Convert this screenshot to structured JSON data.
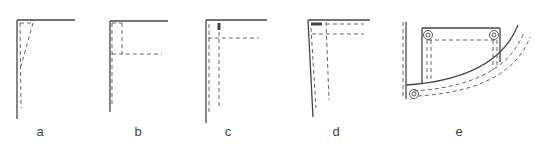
{
  "figure": {
    "panels": [
      {
        "id": "a",
        "label": "a",
        "content": "corner with tapered dashed stitching"
      },
      {
        "id": "b",
        "label": "b",
        "content": "corner with dashed rectangular facing and horizontal stitch line"
      },
      {
        "id": "c",
        "label": "c",
        "content": "corner with double dashed verticals, horizontal stitch line and marker bar"
      },
      {
        "id": "d",
        "label": "d",
        "content": "slanted corner with double dashed lines and horizontal marker bar"
      },
      {
        "id": "e",
        "label": "e",
        "content": "curved pocket with rivets and double topstitching"
      }
    ]
  },
  "colors": {
    "line": "#444444",
    "dash": "#666666",
    "background": "#ffffff"
  }
}
